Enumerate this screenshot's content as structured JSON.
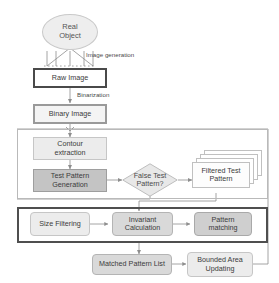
{
  "diagram": {
    "type": "flowchart"
  },
  "nodes": {
    "real_object": "Real\nObject",
    "real_object_line1": "Real",
    "real_object_line2": "Object",
    "raw_image": "Raw Image",
    "binary_image": "Binary Image",
    "contour_extraction_l1": "Contour",
    "contour_extraction_l2": "extraction",
    "test_pattern_generation_l1": "Test Pattern",
    "test_pattern_generation_l2": "Generation",
    "false_test_pattern_l1": "False Test",
    "false_test_pattern_l2": "Pattern?",
    "filtered_test_pattern_l1": "Filtered Test",
    "filtered_test_pattern_l2": "Pattern",
    "size_filtering": "Size Filtering",
    "invariant_calculation_l1": "Invariant",
    "invariant_calculation_l2": "Calculation",
    "pattern_matching_l1": "Pattern",
    "pattern_matching_l2": "matching",
    "matched_pattern_list": "Matched Pattern List",
    "bounded_area_updating_l1": "Bounded Area",
    "bounded_area_updating_l2": "Updating"
  },
  "edge_labels": {
    "image_generation": "Image generation",
    "binarization": "Binarization"
  },
  "colors": {
    "ellipse_fill": "#eeeeee",
    "plain_fill": "#f2f2f2",
    "shade_light": "#ececec",
    "shade_mid": "#d9d9d9",
    "shade_dark": "#cfcfcf",
    "shade_darkest": "#c4c4c4",
    "stroke": "#9a9a9a",
    "heavy_stroke": "#4f4f4f",
    "text": "#3b3b3b"
  }
}
